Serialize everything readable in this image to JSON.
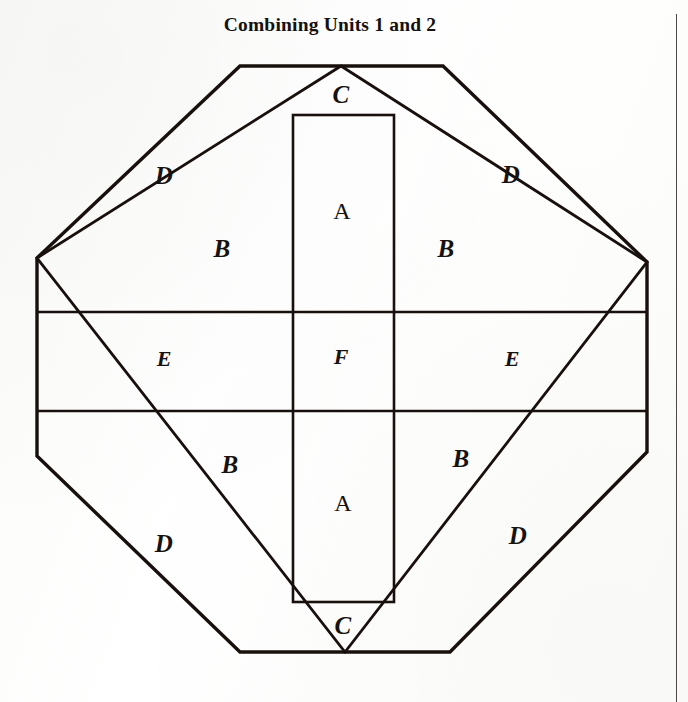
{
  "page": {
    "title": "Combining Units 1 and 2",
    "background_color": "#fdfdfc",
    "ink_color": "#15120f",
    "rule_color": "#4b4845"
  },
  "figure": {
    "name": "octagon-quilt-block-diagram",
    "stroke_color": "#18100c",
    "outer_stroke_width": 3.4,
    "inner_stroke_width": 2.6,
    "octagon_points": "240,66 443,66 647,262 647,452 450,652 240,652 37,456 37,258",
    "diamond_points": "341,66 647,262 345,652 37,258",
    "center_rect": {
      "x": 293,
      "y": 115,
      "width": 101,
      "height": 487
    },
    "band_top_y": 312,
    "band_bottom_y": 411,
    "band_left_x": 37,
    "band_right_x": 647
  },
  "labels": [
    {
      "id": "label-c-top",
      "text": "C",
      "x": 341,
      "y": 95,
      "style": "lbl-script"
    },
    {
      "id": "label-d-top-left",
      "text": "D",
      "x": 164,
      "y": 176,
      "style": "lbl-script"
    },
    {
      "id": "label-d-top-right",
      "text": "D",
      "x": 511,
      "y": 175,
      "style": "lbl-script"
    },
    {
      "id": "label-a-top",
      "text": "A",
      "x": 342,
      "y": 211,
      "style": "lbl-plain"
    },
    {
      "id": "label-b-top-left",
      "text": "B",
      "x": 222,
      "y": 249,
      "style": "lbl-script"
    },
    {
      "id": "label-b-top-right",
      "text": "B",
      "x": 446,
      "y": 249,
      "style": "lbl-script"
    },
    {
      "id": "label-e-left",
      "text": "E",
      "x": 164,
      "y": 359,
      "style": "lbl-small"
    },
    {
      "id": "label-f-center",
      "text": "F",
      "x": 341,
      "y": 357,
      "style": "lbl-small"
    },
    {
      "id": "label-e-right",
      "text": "E",
      "x": 512,
      "y": 359,
      "style": "lbl-small"
    },
    {
      "id": "label-b-bottom-left",
      "text": "B",
      "x": 230,
      "y": 465,
      "style": "lbl-script"
    },
    {
      "id": "label-b-bottom-right",
      "text": "B",
      "x": 461,
      "y": 459,
      "style": "lbl-script"
    },
    {
      "id": "label-a-bottom",
      "text": "A",
      "x": 343,
      "y": 503,
      "style": "lbl-plain"
    },
    {
      "id": "label-d-bottom-left",
      "text": "D",
      "x": 164,
      "y": 544,
      "style": "lbl-script"
    },
    {
      "id": "label-d-bottom-right",
      "text": "D",
      "x": 518,
      "y": 536,
      "style": "lbl-script"
    },
    {
      "id": "label-c-bottom",
      "text": "C",
      "x": 343,
      "y": 626,
      "style": "lbl-script"
    }
  ]
}
